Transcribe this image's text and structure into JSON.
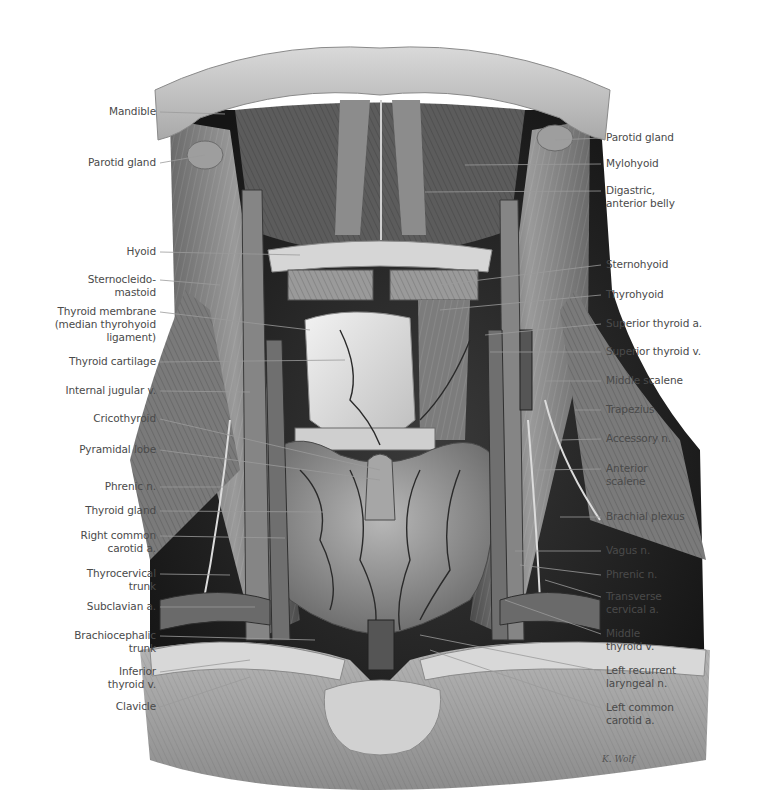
{
  "figure": {
    "signature": "K. Wolf"
  },
  "labels_left": [
    {
      "id": "mandible",
      "text": "Mandible"
    },
    {
      "id": "parotid-gland-right",
      "text": "Parotid gland"
    },
    {
      "id": "hyoid",
      "text": "Hyoid"
    },
    {
      "id": "sternocleidomastoid",
      "text": "Sternocleido-\nmastoid"
    },
    {
      "id": "thyroid-membrane",
      "text": "Thyroid membrane\n(median thyrohyoid\nligament)"
    },
    {
      "id": "thyroid-cartilage",
      "text": "Thyroid cartilage"
    },
    {
      "id": "internal-jugular-v",
      "text": "Internal jugular v."
    },
    {
      "id": "cricothyroid",
      "text": "Cricothyroid"
    },
    {
      "id": "pyramidal-lobe",
      "text": "Pyramidal lobe"
    },
    {
      "id": "phrenic-n-right",
      "text": "Phrenic n."
    },
    {
      "id": "thyroid-gland",
      "text": "Thyroid gland"
    },
    {
      "id": "right-common-carotid-a",
      "text": "Right common\ncarotid a."
    },
    {
      "id": "thyrocervical-trunk",
      "text": "Thyrocervical\ntrunk"
    },
    {
      "id": "subclavian-a",
      "text": "Subclavian a."
    },
    {
      "id": "brachiocephalic-trunk",
      "text": "Brachiocephalic\ntrunk"
    },
    {
      "id": "inferior-thyroid-v",
      "text": "Inferior\nthyroid v."
    },
    {
      "id": "clavicle",
      "text": "Clavicle"
    }
  ],
  "labels_right": [
    {
      "id": "parotid-gland-left",
      "text": "Parotid gland"
    },
    {
      "id": "mylohyoid",
      "text": "Mylohyoid"
    },
    {
      "id": "digastric-anterior-belly",
      "text": "Digastric,\nanterior belly"
    },
    {
      "id": "sternohyoid",
      "text": "Sternohyoid"
    },
    {
      "id": "thyrohyoid",
      "text": "Thyrohyoid"
    },
    {
      "id": "superior-thyroid-a",
      "text": "Superior thyroid a."
    },
    {
      "id": "superior-thyroid-v",
      "text": "Superior thyroid v."
    },
    {
      "id": "middle-scalene",
      "text": "Middle scalene"
    },
    {
      "id": "trapezius",
      "text": "Trapezius"
    },
    {
      "id": "accessory-n",
      "text": "Accessory n."
    },
    {
      "id": "anterior-scalene",
      "text": "Anterior\nscalene"
    },
    {
      "id": "brachial-plexus",
      "text": "Brachial plexus"
    },
    {
      "id": "vagus-n",
      "text": "Vagus n."
    },
    {
      "id": "phrenic-n-left",
      "text": "Phrenic n."
    },
    {
      "id": "transverse-cervical-a",
      "text": "Transverse\ncervical a."
    },
    {
      "id": "middle-thyroid-v",
      "text": "Middle\nthyroid v."
    },
    {
      "id": "left-recurrent-laryngeal-n",
      "text": "Left recurrent\nlaryngeal n."
    },
    {
      "id": "left-common-carotid-a",
      "text": "Left common\ncarotid a."
    }
  ]
}
